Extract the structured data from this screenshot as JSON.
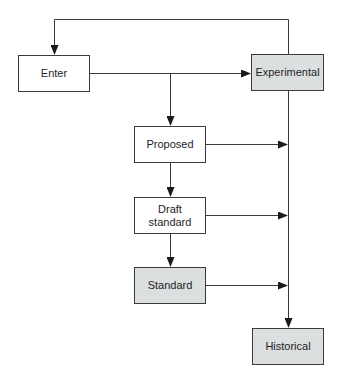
{
  "diagram": {
    "type": "flowchart",
    "colors": {
      "line": "#3a3a3a",
      "plain_fill": "#ffffff",
      "shaded_fill": "#dcdfe0",
      "text": "#1e1e1e"
    },
    "nodes": [
      {
        "id": "enter",
        "label": "Enter",
        "shaded": false
      },
      {
        "id": "experimental",
        "label": "Experimental",
        "shaded": true
      },
      {
        "id": "proposed",
        "label": "Proposed",
        "shaded": false
      },
      {
        "id": "draft",
        "label_line1": "Draft",
        "label_line2": "standard",
        "shaded": false
      },
      {
        "id": "standard",
        "label": "Standard",
        "shaded": true
      },
      {
        "id": "historical",
        "label": "Historical",
        "shaded": true
      }
    ],
    "edges": [
      {
        "from": "experimental",
        "to": "enter",
        "note": "feedback loop along top"
      },
      {
        "from": "enter",
        "to": "experimental"
      },
      {
        "from": "enter",
        "to": "proposed"
      },
      {
        "from": "proposed",
        "to": "draft"
      },
      {
        "from": "draft",
        "to": "standard"
      },
      {
        "from": "proposed",
        "to": "historical"
      },
      {
        "from": "draft",
        "to": "historical"
      },
      {
        "from": "standard",
        "to": "historical"
      },
      {
        "from": "experimental",
        "to": "historical"
      }
    ]
  }
}
